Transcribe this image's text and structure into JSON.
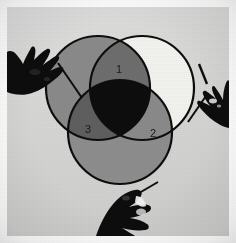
{
  "image": {
    "title": "Three-circle Venn diagram with three pointing hands",
    "width": 236,
    "height": 243,
    "background_color": "#ffffff",
    "paper_color": "#d8d8d6",
    "paper_edge_color": "#e8e8e6"
  },
  "diagram": {
    "type": "venn-3-circle",
    "stroke_color": "#111111",
    "stroke_width": 2.2,
    "circles": [
      {
        "id": "circle-top-left",
        "name": "top-left-circle",
        "cx": 98,
        "cy": 88,
        "r": 52,
        "fill": "#8a8a8a",
        "fill_label": "medium gray"
      },
      {
        "id": "circle-top-right",
        "name": "top-right-circle",
        "cx": 142,
        "cy": 88,
        "r": 52,
        "fill": "#f2f2ef",
        "fill_label": "white / unfilled"
      },
      {
        "id": "circle-bottom",
        "name": "bottom-circle",
        "cx": 120,
        "cy": 132,
        "r": 52,
        "fill": "#8d8d8d",
        "fill_label": "medium gray"
      }
    ],
    "regions": [
      {
        "id": "region-1",
        "name": "overlap-top",
        "label": "1",
        "x": 119,
        "y": 70,
        "fill": "#6e6e6e",
        "description": "intersection of top-left and top-right circles"
      },
      {
        "id": "region-2",
        "name": "overlap-right",
        "label": "2",
        "x": 153,
        "y": 134,
        "fill": "#8a8a8a",
        "description": "intersection of top-right and bottom circles"
      },
      {
        "id": "region-3",
        "name": "overlap-left",
        "label": "3",
        "x": 88,
        "y": 130,
        "fill": "#5e5e5e",
        "description": "intersection of top-left and bottom circles"
      },
      {
        "id": "region-center",
        "name": "triple-intersection",
        "label": "",
        "x": 120,
        "y": 108,
        "fill": "#0d0d0d",
        "description": "intersection of all three circles, solid black"
      }
    ]
  },
  "hands": [
    {
      "id": "hand-left",
      "name": "hand-pointing-left",
      "position": "left",
      "fill": "#0b0b0b",
      "description": "silhouetted hand holding a pen entering from the left edge"
    },
    {
      "id": "hand-right",
      "name": "hand-pointing-right",
      "position": "right",
      "fill": "#0b0b0b",
      "description": "silhouetted hand holding a pen entering from the right edge"
    },
    {
      "id": "hand-bottom",
      "name": "hand-pointing-bottom",
      "position": "bottom",
      "fill": "#0b0b0b",
      "description": "silhouetted hand holding a pen entering from the bottom edge"
    }
  ]
}
